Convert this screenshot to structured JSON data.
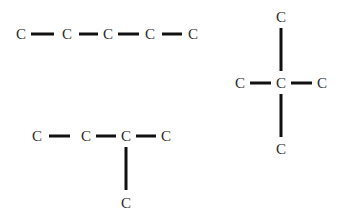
{
  "diagram": {
    "title": "",
    "colors": {
      "bond": "#111111",
      "atom": "#2a2a2a",
      "background": "#ffffff"
    },
    "molecules": [
      {
        "name": "straight-chain-pentane",
        "atoms": [
          {
            "label": "C",
            "x": 21,
            "y": 34
          },
          {
            "label": "C",
            "x": 67,
            "y": 34
          },
          {
            "label": "C",
            "x": 108,
            "y": 34
          },
          {
            "label": "C",
            "x": 150,
            "y": 34
          },
          {
            "label": "C",
            "x": 193,
            "y": 34
          }
        ],
        "bonds": [
          {
            "x1": 31,
            "y1": 34,
            "x2": 54,
            "y2": 34
          },
          {
            "x1": 79,
            "y1": 34,
            "x2": 98,
            "y2": 34
          },
          {
            "x1": 118,
            "y1": 34,
            "x2": 139,
            "y2": 34
          },
          {
            "x1": 162,
            "y1": 34,
            "x2": 182,
            "y2": 34
          }
        ]
      },
      {
        "name": "neopentane",
        "atoms": [
          {
            "label": "C",
            "x": 281,
            "y": 17
          },
          {
            "label": "C",
            "x": 240,
            "y": 83
          },
          {
            "label": "C",
            "x": 281,
            "y": 83
          },
          {
            "label": "C",
            "x": 322,
            "y": 83
          },
          {
            "label": "C",
            "x": 281,
            "y": 149
          }
        ],
        "bonds": [
          {
            "x1": 281,
            "y1": 28,
            "x2": 281,
            "y2": 71
          },
          {
            "x1": 250,
            "y1": 83,
            "x2": 271,
            "y2": 83
          },
          {
            "x1": 291,
            "y1": 83,
            "x2": 312,
            "y2": 83
          },
          {
            "x1": 281,
            "y1": 94,
            "x2": 281,
            "y2": 137
          }
        ]
      },
      {
        "name": "isopentane",
        "atoms": [
          {
            "label": "C",
            "x": 37,
            "y": 136
          },
          {
            "label": "C",
            "x": 86,
            "y": 136
          },
          {
            "label": "C",
            "x": 126,
            "y": 136
          },
          {
            "label": "C",
            "x": 166,
            "y": 136
          },
          {
            "label": "C",
            "x": 126,
            "y": 203
          }
        ],
        "bonds": [
          {
            "x1": 49,
            "y1": 136,
            "x2": 70,
            "y2": 136
          },
          {
            "x1": 96,
            "y1": 136,
            "x2": 116,
            "y2": 136
          },
          {
            "x1": 136,
            "y1": 136,
            "x2": 156,
            "y2": 136
          },
          {
            "x1": 126,
            "y1": 147,
            "x2": 126,
            "y2": 190
          }
        ]
      }
    ]
  }
}
